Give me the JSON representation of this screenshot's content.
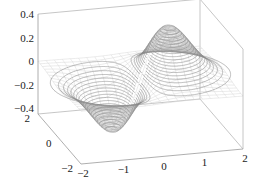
{
  "chart_data": {
    "type": "surface-contour3d",
    "title": "",
    "function": "z = x * exp(-x^2 - y^2)",
    "xlabel": "",
    "ylabel": "",
    "zlabel": "",
    "xlim": [
      -2,
      2
    ],
    "ylim": [
      -2,
      2
    ],
    "zlim": [
      -0.45,
      0.4
    ],
    "x_ticks": [
      -2,
      -1,
      0,
      1,
      2
    ],
    "x_tick_labels": [
      "−2",
      "−1",
      "0",
      "1",
      "2"
    ],
    "y_ticks": [
      -2,
      0,
      2
    ],
    "y_tick_labels": [
      "−2",
      "0",
      "2"
    ],
    "z_ticks": [
      0.4,
      0.2,
      0,
      -0.2,
      -0.4
    ],
    "z_tick_labels": [
      "0.4",
      "0.2",
      "0",
      "−0.2",
      "−0.4"
    ],
    "peak": {
      "x": 0.707,
      "y": 0,
      "z": 0.429
    },
    "trough": {
      "x": -0.707,
      "y": 0,
      "z": -0.429
    },
    "contour_levels": 20,
    "mesh_steps": 20,
    "grid": false,
    "box": true,
    "colors": {
      "contour": "#8a8a8a",
      "mesh": "#d6d6d6",
      "box": "#b8b8b8",
      "text": "#222222"
    }
  }
}
